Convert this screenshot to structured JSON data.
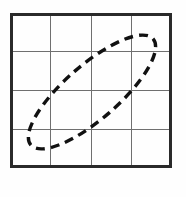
{
  "figure": {
    "title": "Dashed tilted ellipse inscribed on a 4 by 4 square grid",
    "background_color": "#fefefe",
    "canvas": {
      "width": 186,
      "height": 197
    }
  },
  "grid": {
    "name": "square-grid",
    "columns": 4,
    "rows": 4,
    "border_color": "#2a2a2a",
    "border_width": 3,
    "line_color": "#6f6f6f",
    "line_width": 1,
    "x_left": 10,
    "x_right": 172,
    "y_top": 13,
    "y_bottom": 168,
    "vertical_x": [
      10,
      50.5,
      91,
      131.5,
      172
    ],
    "horizontal_y": [
      13,
      51.75,
      90.5,
      129.25,
      168
    ]
  },
  "chart_data": {
    "type": "scatter",
    "xlabel": "",
    "ylabel": "",
    "grid": true,
    "legend": null,
    "annotations": [],
    "shapes": [
      {
        "name": "dashed-ellipse",
        "kind": "ellipse",
        "style": "dashed",
        "stroke_color": "#111111",
        "stroke_width": 3.4,
        "dash_length": 9,
        "dash_gap": 6,
        "center_x": 92,
        "center_y": 92,
        "semi_major": 81,
        "semi_minor": 27,
        "rotation_degrees": -41,
        "extreme_points": {
          "top_right_tip_x": 154,
          "top_right_tip_y": 33,
          "bottom_left_tip_x": 32,
          "bottom_left_tip_y": 152,
          "leftmost_x": 29,
          "rightmost_x": 155,
          "topmost_y": 32,
          "bottommost_y": 153
        }
      }
    ]
  }
}
